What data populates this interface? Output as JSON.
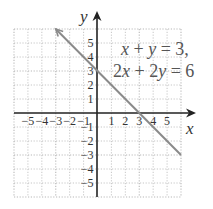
{
  "chart_data": {
    "type": "line",
    "title": "",
    "xlabel": "x",
    "ylabel": "y",
    "xlim": [
      -6,
      6
    ],
    "ylim": [
      -6,
      6
    ],
    "grid": true,
    "x_ticks": [
      -5,
      -4,
      -3,
      -2,
      -1,
      1,
      2,
      3,
      4,
      5
    ],
    "y_ticks": [
      -5,
      -4,
      -3,
      -2,
      -1,
      1,
      2,
      3,
      4,
      5
    ],
    "x_tick_labels": [
      "−5",
      "−4",
      "−3",
      "−2",
      "−1",
      "1",
      "2",
      "3",
      "4",
      "5"
    ],
    "y_tick_labels": [
      "−5",
      "−4",
      "−3",
      "−2",
      "−1",
      "1",
      "2",
      "3",
      "4",
      "5"
    ],
    "series": [
      {
        "name": "x + y = 3, 2x + 2y = 6",
        "x": [
          -3,
          6
        ],
        "y": [
          6,
          -3
        ],
        "color": "#8a8a8a",
        "arrow_at_start": true
      }
    ],
    "annotations": [
      {
        "text": "x + y = 3,",
        "position": "upper right"
      },
      {
        "text": "2x + 2y = 6",
        "position": "upper right"
      }
    ]
  },
  "labels": {
    "x_axis": "x",
    "y_axis": "y",
    "eq1": {
      "a": "x",
      "op1": " + ",
      "b": "y",
      "rest": " = 3,"
    },
    "eq2": {
      "a": "2",
      "av": "x",
      "op1": " + 2",
      "bv": "y",
      "rest": " = 6"
    }
  },
  "colors": {
    "grid": "#b8b8b8",
    "axis": "#222222",
    "line": "#8a8a8a",
    "text": "#333333"
  }
}
